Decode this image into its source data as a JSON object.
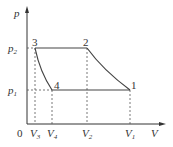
{
  "diagram": {
    "axes": {
      "y_label": "p",
      "x_label": "V",
      "origin_label": "0"
    },
    "y_ticks": [
      {
        "base": "p",
        "sub": "2"
      },
      {
        "base": "p",
        "sub": "1"
      }
    ],
    "x_ticks": [
      {
        "base": "V",
        "sub": "3"
      },
      {
        "base": "V",
        "sub": "4"
      },
      {
        "base": "V",
        "sub": "2"
      },
      {
        "base": "V",
        "sub": "1"
      }
    ],
    "points": [
      {
        "label": "1"
      },
      {
        "label": "2"
      },
      {
        "label": "3"
      },
      {
        "label": "4"
      }
    ],
    "colors": {
      "line": "#444444",
      "dashed": "#555555"
    }
  }
}
